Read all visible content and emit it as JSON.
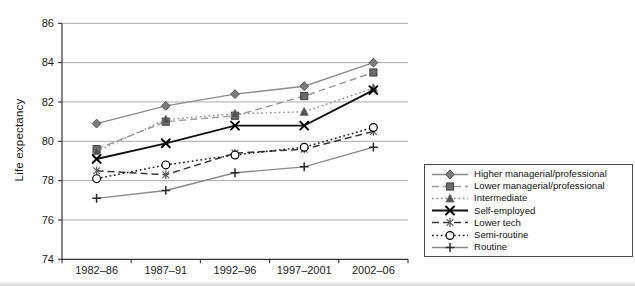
{
  "chart_data": {
    "type": "line",
    "title": "",
    "xlabel": "",
    "ylabel": "Life expectancy",
    "categories": [
      "1982–86",
      "1987–91",
      "1992–96",
      "1997–2001",
      "2002–06"
    ],
    "ylim": [
      74,
      86
    ],
    "yticks": [
      74,
      76,
      78,
      80,
      82,
      84,
      86
    ],
    "grid": true,
    "legend_position": "bottom-right",
    "series": [
      {
        "name": "Higher managerial/professional",
        "marker": "diamond",
        "line": "solid",
        "color": "#8c8c8c",
        "width": 1.4,
        "values": [
          80.9,
          81.8,
          82.4,
          82.8,
          84.0
        ]
      },
      {
        "name": "Lower managerial/professional",
        "marker": "square",
        "line": "dashed",
        "color": "#9a9a9a",
        "width": 1.4,
        "values": [
          79.6,
          81.0,
          81.3,
          82.3,
          83.5
        ]
      },
      {
        "name": "Intermediate",
        "marker": "triangle",
        "line": "dotted",
        "color": "#8f8f8f",
        "width": 1.4,
        "values": [
          79.5,
          81.1,
          81.4,
          81.5,
          82.7
        ]
      },
      {
        "name": "Self-employed",
        "marker": "x",
        "line": "solid",
        "color": "#111111",
        "width": 1.8,
        "values": [
          79.1,
          79.9,
          80.8,
          80.8,
          82.6
        ]
      },
      {
        "name": "Lower tech",
        "marker": "star",
        "line": "dashed",
        "color": "#383838",
        "width": 1.5,
        "values": [
          78.5,
          78.3,
          79.4,
          79.6,
          80.5
        ]
      },
      {
        "name": "Semi-routine",
        "marker": "circle-open",
        "line": "dotted",
        "color": "#1a1a1a",
        "width": 1.5,
        "values": [
          78.1,
          78.8,
          79.3,
          79.7,
          80.7
        ]
      },
      {
        "name": "Routine",
        "marker": "plus",
        "line": "solid",
        "color": "#8a8a8a",
        "width": 1.4,
        "values": [
          77.1,
          77.5,
          78.4,
          78.7,
          79.7
        ]
      }
    ]
  }
}
